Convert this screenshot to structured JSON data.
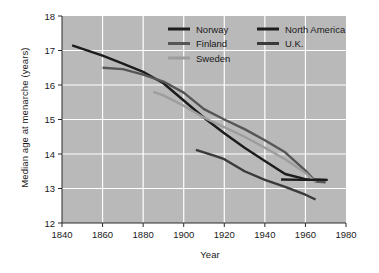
{
  "chart_data": {
    "type": "line",
    "title": "",
    "xlabel": "Year",
    "ylabel": "Median age at menarche (years)",
    "xlim": [
      1840,
      1980
    ],
    "ylim": [
      12,
      18
    ],
    "xticks": [
      1840,
      1860,
      1880,
      1900,
      1920,
      1940,
      1960,
      1980
    ],
    "yticks": [
      12,
      13,
      14,
      15,
      16,
      17,
      18
    ],
    "grid": true,
    "legend_position": "top-right",
    "plot_background": "#b9b9b9",
    "grid_color": "#ffffff",
    "series": [
      {
        "name": "Norway",
        "color": "#1c1c1c",
        "points": [
          [
            1845,
            17.15
          ],
          [
            1860,
            16.85
          ],
          [
            1870,
            16.62
          ],
          [
            1880,
            16.38
          ],
          [
            1890,
            16.05
          ],
          [
            1900,
            15.55
          ],
          [
            1910,
            15.05
          ],
          [
            1920,
            14.6
          ],
          [
            1930,
            14.18
          ],
          [
            1940,
            13.8
          ],
          [
            1950,
            13.42
          ],
          [
            1960,
            13.27
          ],
          [
            1970,
            13.25
          ]
        ]
      },
      {
        "name": "Finland",
        "color": "#565656",
        "points": [
          [
            1860,
            16.5
          ],
          [
            1870,
            16.46
          ],
          [
            1880,
            16.3
          ],
          [
            1890,
            16.1
          ],
          [
            1900,
            15.78
          ],
          [
            1910,
            15.3
          ],
          [
            1920,
            15.0
          ],
          [
            1930,
            14.72
          ],
          [
            1940,
            14.4
          ],
          [
            1950,
            14.05
          ],
          [
            1960,
            13.52
          ],
          [
            1965,
            13.2
          ],
          [
            1970,
            13.18
          ]
        ]
      },
      {
        "name": "Sweden",
        "color": "#9d9d9d",
        "points": [
          [
            1885,
            15.8
          ],
          [
            1890,
            15.7
          ],
          [
            1900,
            15.4
          ],
          [
            1910,
            15.05
          ],
          [
            1920,
            14.78
          ],
          [
            1930,
            14.5
          ],
          [
            1940,
            14.18
          ],
          [
            1950,
            13.85
          ],
          [
            1960,
            13.45
          ],
          [
            1965,
            13.18
          ]
        ]
      },
      {
        "name": "North America",
        "color": "#1c1c1c",
        "points": [
          [
            1948,
            13.26
          ],
          [
            1960,
            13.25
          ],
          [
            1971,
            13.25
          ]
        ]
      },
      {
        "name": "U.K.",
        "color": "#3a3a3a",
        "points": [
          [
            1906,
            14.12
          ],
          [
            1915,
            13.95
          ],
          [
            1920,
            13.85
          ],
          [
            1930,
            13.5
          ],
          [
            1940,
            13.25
          ],
          [
            1950,
            13.05
          ],
          [
            1960,
            12.82
          ],
          [
            1965,
            12.68
          ]
        ]
      }
    ],
    "legend": [
      {
        "label": "Norway",
        "color": "#1c1c1c"
      },
      {
        "label": "Finland",
        "color": "#565656"
      },
      {
        "label": "Sweden",
        "color": "#9d9d9d"
      },
      {
        "label": "North America",
        "color": "#1c1c1c"
      },
      {
        "label": "U.K.",
        "color": "#3a3a3a"
      }
    ]
  }
}
